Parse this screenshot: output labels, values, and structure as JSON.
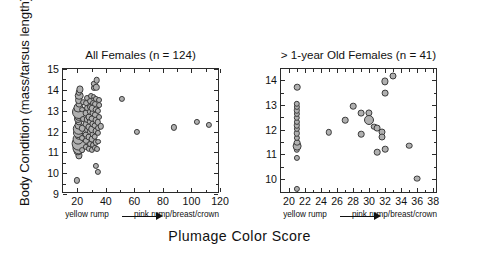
{
  "figure": {
    "ylabel": "Body Condition (mass/tarsus length)",
    "xlabel": "Plumage Color Score",
    "gradient_left": "yellow rump",
    "gradient_right": "pink rump/breast/crown"
  },
  "chart_data": [
    {
      "type": "scatter",
      "title": "All Females (n = 124)",
      "xlabel": "Plumage Color Score",
      "ylabel": "Body Condition (mass/tarsus length)",
      "xlim": [
        10,
        120
      ],
      "ylim": [
        9,
        15
      ],
      "xticks": [
        20,
        40,
        60,
        80,
        100,
        120
      ],
      "yticks": [
        9,
        10,
        11,
        12,
        13,
        14,
        15
      ],
      "xtick_labels": [
        "20",
        "40",
        "60",
        "80",
        "100",
        "120"
      ],
      "ytick_labels": [
        "9",
        "10",
        "11",
        "12",
        "13",
        "14",
        "15"
      ],
      "grid": false,
      "legend": false,
      "n": 124,
      "marker_note": "circle size proportional to number of overlapping observations",
      "points": [
        {
          "x": 20.0,
          "y": 9.65,
          "r": 3.1
        },
        {
          "x": 21.0,
          "y": 10.85,
          "r": 3.6
        },
        {
          "x": 20.6,
          "y": 11.08,
          "r": 4.6
        },
        {
          "x": 20.9,
          "y": 11.22,
          "r": 6.6
        },
        {
          "x": 21.2,
          "y": 11.42,
          "r": 7.4
        },
        {
          "x": 20.8,
          "y": 11.62,
          "r": 5.4
        },
        {
          "x": 21.3,
          "y": 11.78,
          "r": 4.2
        },
        {
          "x": 20.7,
          "y": 11.95,
          "r": 5.0
        },
        {
          "x": 21.1,
          "y": 12.12,
          "r": 6.2
        },
        {
          "x": 20.9,
          "y": 12.3,
          "r": 4.4
        },
        {
          "x": 21.4,
          "y": 12.45,
          "r": 3.6
        },
        {
          "x": 20.6,
          "y": 12.6,
          "r": 4.0
        },
        {
          "x": 21.0,
          "y": 12.78,
          "r": 5.2
        },
        {
          "x": 21.3,
          "y": 12.95,
          "r": 7.0
        },
        {
          "x": 20.8,
          "y": 13.12,
          "r": 4.6
        },
        {
          "x": 21.2,
          "y": 13.3,
          "r": 3.4
        },
        {
          "x": 20.9,
          "y": 13.5,
          "r": 3.9
        },
        {
          "x": 21.5,
          "y": 13.72,
          "r": 4.3
        },
        {
          "x": 21.0,
          "y": 13.88,
          "r": 3.2
        },
        {
          "x": 21.6,
          "y": 14.02,
          "r": 3.6
        },
        {
          "x": 23.2,
          "y": 11.1,
          "r": 2.9
        },
        {
          "x": 23.6,
          "y": 11.7,
          "r": 3.0
        },
        {
          "x": 23.4,
          "y": 12.15,
          "r": 3.2
        },
        {
          "x": 23.8,
          "y": 12.62,
          "r": 3.0
        },
        {
          "x": 23.3,
          "y": 13.05,
          "r": 2.9
        },
        {
          "x": 24.0,
          "y": 13.4,
          "r": 2.8
        },
        {
          "x": 25.8,
          "y": 11.25,
          "r": 3.1
        },
        {
          "x": 26.3,
          "y": 11.55,
          "r": 3.2
        },
        {
          "x": 26.0,
          "y": 11.85,
          "r": 3.4
        },
        {
          "x": 26.6,
          "y": 12.08,
          "r": 3.0
        },
        {
          "x": 26.1,
          "y": 12.35,
          "r": 3.3
        },
        {
          "x": 26.8,
          "y": 12.58,
          "r": 3.1
        },
        {
          "x": 26.2,
          "y": 12.88,
          "r": 3.4
        },
        {
          "x": 26.9,
          "y": 13.12,
          "r": 3.0
        },
        {
          "x": 26.4,
          "y": 13.38,
          "r": 2.9
        },
        {
          "x": 27.0,
          "y": 13.62,
          "r": 3.0
        },
        {
          "x": 28.2,
          "y": 11.18,
          "r": 3.2
        },
        {
          "x": 28.7,
          "y": 11.42,
          "r": 3.0
        },
        {
          "x": 28.3,
          "y": 11.72,
          "r": 3.5
        },
        {
          "x": 28.9,
          "y": 11.98,
          "r": 3.2
        },
        {
          "x": 28.4,
          "y": 12.22,
          "r": 3.6
        },
        {
          "x": 29.0,
          "y": 12.48,
          "r": 3.3
        },
        {
          "x": 28.5,
          "y": 12.72,
          "r": 3.5
        },
        {
          "x": 29.1,
          "y": 12.95,
          "r": 3.2
        },
        {
          "x": 28.6,
          "y": 13.18,
          "r": 3.0
        },
        {
          "x": 29.2,
          "y": 13.45,
          "r": 2.9
        },
        {
          "x": 29.4,
          "y": 13.72,
          "r": 3.0
        },
        {
          "x": 30.2,
          "y": 11.12,
          "r": 3.1
        },
        {
          "x": 30.8,
          "y": 11.35,
          "r": 3.0
        },
        {
          "x": 30.3,
          "y": 11.62,
          "r": 3.4
        },
        {
          "x": 30.9,
          "y": 11.88,
          "r": 3.5
        },
        {
          "x": 30.4,
          "y": 12.12,
          "r": 3.8
        },
        {
          "x": 31.0,
          "y": 12.38,
          "r": 3.6
        },
        {
          "x": 30.5,
          "y": 12.62,
          "r": 3.4
        },
        {
          "x": 31.1,
          "y": 12.88,
          "r": 3.5
        },
        {
          "x": 30.6,
          "y": 13.12,
          "r": 3.2
        },
        {
          "x": 31.2,
          "y": 13.38,
          "r": 3.0
        },
        {
          "x": 31.4,
          "y": 13.68,
          "r": 2.9
        },
        {
          "x": 31.6,
          "y": 14.08,
          "r": 3.1
        },
        {
          "x": 31.8,
          "y": 14.28,
          "r": 3.2
        },
        {
          "x": 32.2,
          "y": 11.2,
          "r": 3.1
        },
        {
          "x": 32.8,
          "y": 11.48,
          "r": 3.2
        },
        {
          "x": 32.3,
          "y": 11.75,
          "r": 3.3
        },
        {
          "x": 32.9,
          "y": 12.02,
          "r": 3.5
        },
        {
          "x": 32.4,
          "y": 12.28,
          "r": 3.4
        },
        {
          "x": 33.0,
          "y": 12.55,
          "r": 3.3
        },
        {
          "x": 32.5,
          "y": 12.8,
          "r": 3.2
        },
        {
          "x": 33.1,
          "y": 13.05,
          "r": 3.4
        },
        {
          "x": 32.6,
          "y": 13.3,
          "r": 3.0
        },
        {
          "x": 33.2,
          "y": 13.55,
          "r": 3.1
        },
        {
          "x": 33.4,
          "y": 14.12,
          "r": 3.2
        },
        {
          "x": 33.6,
          "y": 14.45,
          "r": 3.3
        },
        {
          "x": 34.0,
          "y": 11.18,
          "r": 3.0
        },
        {
          "x": 34.5,
          "y": 11.52,
          "r": 2.9
        },
        {
          "x": 34.2,
          "y": 11.92,
          "r": 3.1
        },
        {
          "x": 34.8,
          "y": 12.18,
          "r": 3.0
        },
        {
          "x": 34.4,
          "y": 12.45,
          "r": 3.2
        },
        {
          "x": 35.0,
          "y": 12.72,
          "r": 3.0
        },
        {
          "x": 34.6,
          "y": 13.0,
          "r": 3.1
        },
        {
          "x": 35.2,
          "y": 13.25,
          "r": 2.9
        },
        {
          "x": 35.4,
          "y": 13.5,
          "r": 3.0
        },
        {
          "x": 33.0,
          "y": 10.35,
          "r": 3.1
        },
        {
          "x": 34.4,
          "y": 10.05,
          "r": 3.1
        },
        {
          "x": 36.5,
          "y": 12.25,
          "r": 3.2
        },
        {
          "x": 51.5,
          "y": 13.55,
          "r": 3.1
        },
        {
          "x": 61.5,
          "y": 11.98,
          "r": 3.1
        },
        {
          "x": 87.5,
          "y": 12.2,
          "r": 3.1
        },
        {
          "x": 104.0,
          "y": 12.45,
          "r": 3.1
        },
        {
          "x": 112.5,
          "y": 12.3,
          "r": 3.1
        }
      ]
    },
    {
      "type": "scatter",
      "title": "> 1-year Old Females (n = 41)",
      "xlabel": "Plumage Color Score",
      "ylabel": "Body Condition (mass/tarsus length)",
      "xlim": [
        19,
        38.6
      ],
      "ylim": [
        9.4,
        14.45
      ],
      "xticks": [
        20,
        22,
        24,
        26,
        28,
        30,
        32,
        34,
        36,
        38
      ],
      "yticks": [
        10,
        11,
        12,
        13,
        14
      ],
      "xtick_labels": [
        "20",
        "22",
        "24",
        "26",
        "28",
        "30",
        "32",
        "34",
        "36",
        "38"
      ],
      "ytick_labels": [
        "10",
        "11",
        "12",
        "13",
        "14"
      ],
      "grid": false,
      "legend": false,
      "n": 41,
      "marker_note": "circle size proportional to number of overlapping observations",
      "points": [
        {
          "x": 21.0,
          "y": 9.62,
          "r": 3.1
        },
        {
          "x": 21.0,
          "y": 10.85,
          "r": 3.1
        },
        {
          "x": 21.0,
          "y": 11.18,
          "r": 3.2
        },
        {
          "x": 21.0,
          "y": 11.32,
          "r": 4.4
        },
        {
          "x": 21.0,
          "y": 11.48,
          "r": 3.4
        },
        {
          "x": 21.0,
          "y": 11.68,
          "r": 3.1
        },
        {
          "x": 21.0,
          "y": 11.85,
          "r": 3.2
        },
        {
          "x": 21.0,
          "y": 12.02,
          "r": 3.1
        },
        {
          "x": 21.0,
          "y": 12.18,
          "r": 3.2
        },
        {
          "x": 21.0,
          "y": 12.32,
          "r": 3.1
        },
        {
          "x": 21.0,
          "y": 12.48,
          "r": 3.2
        },
        {
          "x": 21.0,
          "y": 12.62,
          "r": 3.1
        },
        {
          "x": 21.0,
          "y": 12.78,
          "r": 3.2
        },
        {
          "x": 21.0,
          "y": 12.92,
          "r": 3.1
        },
        {
          "x": 21.0,
          "y": 13.05,
          "r": 3.2
        },
        {
          "x": 21.0,
          "y": 13.72,
          "r": 3.3
        },
        {
          "x": 25.0,
          "y": 11.9,
          "r": 3.2
        },
        {
          "x": 27.0,
          "y": 12.38,
          "r": 3.3
        },
        {
          "x": 28.0,
          "y": 12.95,
          "r": 3.3
        },
        {
          "x": 29.0,
          "y": 12.68,
          "r": 3.4
        },
        {
          "x": 29.0,
          "y": 11.82,
          "r": 3.3
        },
        {
          "x": 30.0,
          "y": 12.68,
          "r": 3.6
        },
        {
          "x": 30.0,
          "y": 12.38,
          "r": 5.0
        },
        {
          "x": 30.6,
          "y": 12.12,
          "r": 3.3
        },
        {
          "x": 31.0,
          "y": 12.05,
          "r": 3.4
        },
        {
          "x": 31.0,
          "y": 11.08,
          "r": 3.3
        },
        {
          "x": 31.6,
          "y": 11.9,
          "r": 3.5
        },
        {
          "x": 31.6,
          "y": 11.72,
          "r": 3.5
        },
        {
          "x": 32.0,
          "y": 11.2,
          "r": 3.3
        },
        {
          "x": 32.0,
          "y": 13.48,
          "r": 3.4
        },
        {
          "x": 32.0,
          "y": 13.95,
          "r": 3.6
        },
        {
          "x": 33.0,
          "y": 14.18,
          "r": 3.5
        },
        {
          "x": 35.0,
          "y": 11.35,
          "r": 3.3
        },
        {
          "x": 36.0,
          "y": 10.02,
          "r": 3.4
        }
      ]
    }
  ]
}
